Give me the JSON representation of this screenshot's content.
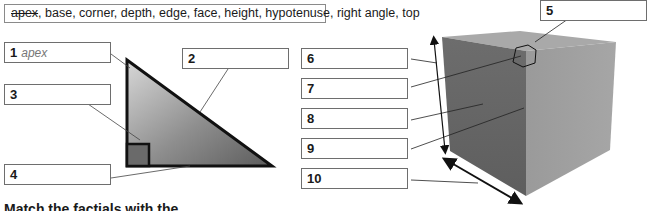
{
  "word_bank": {
    "struck_word": "apex",
    "remaining": ", base, corner, depth, edge, face, height, hypotenuse, right angle, top"
  },
  "triangle_labels": [
    {
      "number": "1",
      "answer": "apex"
    },
    {
      "number": "2",
      "answer": ""
    },
    {
      "number": "3",
      "answer": ""
    },
    {
      "number": "4",
      "answer": ""
    }
  ],
  "cube_labels": [
    {
      "number": "5",
      "answer": ""
    },
    {
      "number": "6",
      "answer": ""
    },
    {
      "number": "7",
      "answer": ""
    },
    {
      "number": "8",
      "answer": ""
    },
    {
      "number": "9",
      "answer": ""
    },
    {
      "number": "10",
      "answer": ""
    }
  ],
  "instruction": "Match the factials with the"
}
